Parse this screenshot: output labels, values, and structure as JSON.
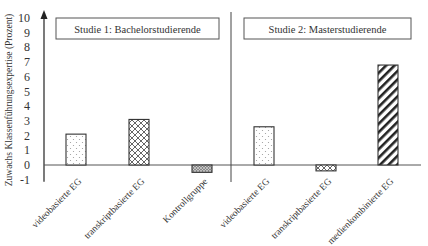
{
  "chart_data": {
    "type": "bar",
    "title": "",
    "xlabel": "",
    "ylabel": "Zuwachs Klassenführungsexpertise (Prozent)",
    "ylim": [
      -1,
      10
    ],
    "yticks": [
      -1,
      0,
      1,
      2,
      3,
      4,
      5,
      6,
      7,
      8,
      9,
      10
    ],
    "grid": false,
    "legend_position": "none",
    "panels": [
      {
        "label": "Studie 1: Bachelorstudierende",
        "categories": [
          "videobasierte EG",
          "transkriptbasierte EG",
          "Kontrollgruppe"
        ],
        "values": [
          2.1,
          3.1,
          -0.5
        ],
        "patterns": [
          "dots",
          "crosshatch",
          "dense-hatch"
        ]
      },
      {
        "label": "Studie 2: Masterstudierende",
        "categories": [
          "videobasierte EG",
          "transkriptbasierte EG",
          "medienkombinierte EG"
        ],
        "values": [
          2.6,
          -0.4,
          6.8
        ],
        "patterns": [
          "dots",
          "crosshatch",
          "diagonal"
        ]
      }
    ],
    "categories": [
      "videobasierte EG",
      "transkriptbasierte EG",
      "Kontrollgruppe",
      "videobasierte EG",
      "transkriptbasierte EG",
      "medienkombinierte EG"
    ],
    "values": [
      2.1,
      3.1,
      -0.5,
      2.6,
      -0.4,
      6.8
    ]
  },
  "colors": {
    "axis": "#222222",
    "bar_outline": "#333333",
    "box_border": "#555555",
    "text": "#333333"
  }
}
